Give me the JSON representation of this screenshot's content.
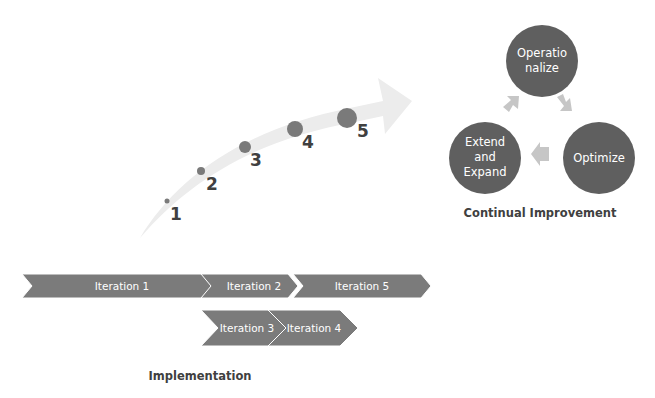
{
  "growth_arrow": {
    "steps": [
      {
        "label": "1"
      },
      {
        "label": "2"
      },
      {
        "label": "3"
      },
      {
        "label": "4"
      },
      {
        "label": "5"
      }
    ]
  },
  "continual_improvement": {
    "title": "Continual Improvement",
    "cycle": [
      {
        "line1": "Operatio",
        "line2": "nalize"
      },
      {
        "line1": "Optimize"
      },
      {
        "line1": "Extend",
        "line2": "and",
        "line3": "Expand"
      }
    ]
  },
  "implementation": {
    "title": "Implementation",
    "iterations": [
      {
        "label": "Iteration 1"
      },
      {
        "label": "Iteration 2"
      },
      {
        "label": "Iteration 5"
      },
      {
        "label": "Iteration 3"
      },
      {
        "label": "Iteration 4"
      }
    ]
  },
  "colors": {
    "circle_fill": "#5f5f5f",
    "chevron_fill": "#7b7b7b",
    "dot_fill": "#7a7a7a",
    "arrow_fill": "#ececec",
    "small_arrow_fill": "#c6c6c6",
    "label_text": "#404040"
  }
}
